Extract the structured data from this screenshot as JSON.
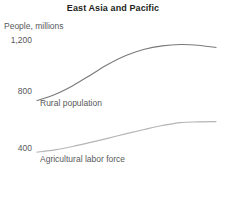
{
  "chart_data": {
    "type": "line",
    "title": "East Asia and Pacific",
    "subtitle": "People, millions",
    "xlabel": "",
    "ylabel": "People, millions",
    "ylim": [
      200,
      1320
    ],
    "yticks": [
      1200,
      800,
      400
    ],
    "ytick_labels": [
      "1,200",
      "800",
      "400"
    ],
    "grid": false,
    "legend_position": "inline-labels",
    "xlim": [
      0,
      100
    ],
    "x": [
      0,
      10,
      20,
      30,
      40,
      50,
      60,
      70,
      80,
      90,
      100
    ],
    "series": [
      {
        "name": "Rural population",
        "color": "#7a7a7a",
        "values": [
          770,
          815,
          880,
          960,
          1040,
          1105,
          1150,
          1175,
          1185,
          1180,
          1163
        ]
      },
      {
        "name": "Agricultural labor force",
        "color": "#b5b5b5",
        "values": [
          388,
          405,
          430,
          460,
          492,
          525,
          556,
          585,
          607,
          612,
          614
        ]
      }
    ]
  }
}
